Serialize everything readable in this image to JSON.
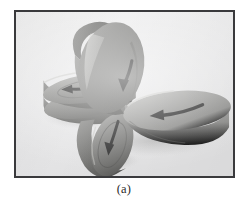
{
  "figure": {
    "caption": "(a)",
    "alt_title": "Four disc-shaped rotors arranged in a pinwheel, each face marked with a dark curved rotation arrow",
    "photo": {
      "background_color": "#ececed",
      "frame_color": "#3a3a3c",
      "frame_width_px": 2,
      "page_background": "#ffffff"
    },
    "objects": [
      {
        "name": "top-disc",
        "label": "upper disc",
        "orientation": "tilted upright, facing lower-right",
        "body_color": "#8d8d8c",
        "rim_color": "#6f6f6e",
        "arrow_color": "#2e2e2e"
      },
      {
        "name": "left-disc-stack",
        "label": "left stacked discs",
        "orientation": "edge-on, facing right",
        "body_color": "#9a9a98",
        "rim_color": "#747472",
        "arrow_color": "#2e2e2e"
      },
      {
        "name": "right-disc",
        "label": "right disc",
        "orientation": "lying flat, face up",
        "body_color": "#a2a2a0",
        "rim_color": "#7b7b79",
        "arrow_color": "#2b2b2b"
      },
      {
        "name": "bottom-disc",
        "label": "lower disc",
        "orientation": "tilted upright, facing upper-right",
        "body_color": "#8a8a88",
        "rim_color": "#6b6b69",
        "arrow_color": "#2e2e2e"
      }
    ]
  }
}
